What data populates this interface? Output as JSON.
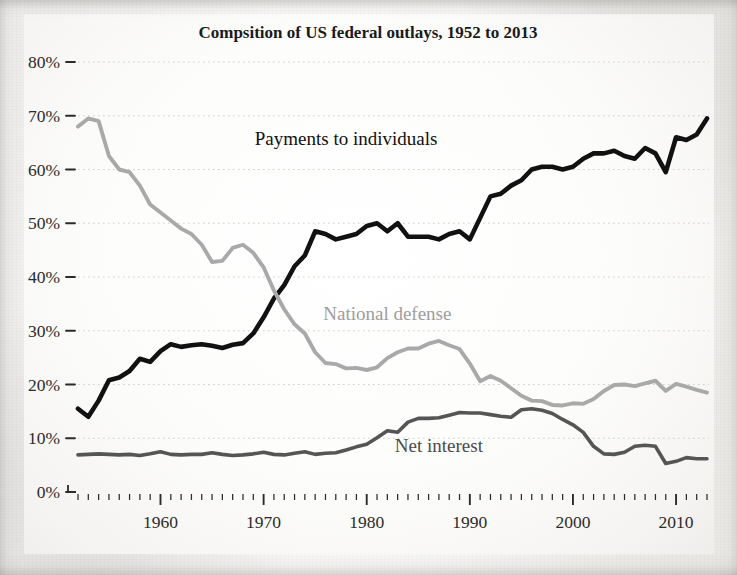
{
  "chart_data": {
    "type": "line",
    "title": "Compsition of US federal outlays, 1952 to 2013",
    "xlabel": "",
    "ylabel": "",
    "xlim": [
      1952,
      2013
    ],
    "ylim": [
      0,
      80
    ],
    "grid": true,
    "grid_axis": "y",
    "legend": "inline-labels",
    "y_tick_labels": [
      "0%",
      "10%",
      "20%",
      "30%",
      "40%",
      "50%",
      "60%",
      "70%",
      "80%"
    ],
    "y_tick_values": [
      0,
      10,
      20,
      30,
      40,
      50,
      60,
      70,
      80
    ],
    "x_tick_labels": [
      "1960",
      "1970",
      "1980",
      "1990",
      "2000",
      "2010"
    ],
    "x_tick_values": [
      1960,
      1970,
      1980,
      1990,
      2000,
      2010
    ],
    "x_minor_tick_step": 1,
    "x": [
      1952,
      1953,
      1954,
      1955,
      1956,
      1957,
      1958,
      1959,
      1960,
      1961,
      1962,
      1963,
      1964,
      1965,
      1966,
      1967,
      1968,
      1969,
      1970,
      1971,
      1972,
      1973,
      1974,
      1975,
      1976,
      1977,
      1978,
      1979,
      1980,
      1981,
      1982,
      1983,
      1984,
      1985,
      1986,
      1987,
      1988,
      1989,
      1990,
      1991,
      1992,
      1993,
      1994,
      1995,
      1996,
      1997,
      1998,
      1999,
      2000,
      2001,
      2002,
      2003,
      2004,
      2005,
      2006,
      2007,
      2008,
      2009,
      2010,
      2011,
      2012,
      2013
    ],
    "series": [
      {
        "name": "Payments to individuals",
        "color": "#111111",
        "label_x": 1978,
        "label_y": 64.5,
        "values": [
          15.5,
          14.0,
          17.0,
          20.8,
          21.3,
          22.5,
          24.8,
          24.2,
          26.2,
          27.5,
          27.0,
          27.3,
          27.5,
          27.2,
          26.8,
          27.4,
          27.7,
          29.5,
          32.5,
          36.0,
          38.5,
          42.0,
          44.0,
          48.5,
          48.0,
          47.0,
          47.5,
          48.0,
          49.5,
          50.0,
          48.5,
          50.0,
          47.5,
          47.5,
          47.5,
          47.0,
          48.0,
          48.5,
          47.0,
          51.0,
          55.0,
          55.5,
          57.0,
          58.0,
          60.0,
          60.5,
          60.5,
          60.0,
          60.5,
          62.0,
          63.0,
          63.0,
          63.5,
          62.5,
          62.0,
          64.0,
          63.0,
          59.5,
          66.0,
          65.5,
          66.5,
          69.5
        ]
      },
      {
        "name": "National defense",
        "color": "#a9a9a9",
        "label_x": 1982,
        "label_y": 32.0,
        "values": [
          68.0,
          69.5,
          69.0,
          62.5,
          60.0,
          59.5,
          57.0,
          53.5,
          52.0,
          50.5,
          49.0,
          48.0,
          46.0,
          42.8,
          43.0,
          45.4,
          46.0,
          44.5,
          41.8,
          37.5,
          34.0,
          31.2,
          29.5,
          26.0,
          24.0,
          23.8,
          23.0,
          23.1,
          22.7,
          23.2,
          24.9,
          26.0,
          26.7,
          26.7,
          27.6,
          28.1,
          27.3,
          26.6,
          23.9,
          20.6,
          21.6,
          20.7,
          19.3,
          17.9,
          17.0,
          16.9,
          16.2,
          16.1,
          16.5,
          16.4,
          17.3,
          18.8,
          19.9,
          20.0,
          19.7,
          20.2,
          20.7,
          18.8,
          20.1,
          19.6,
          19.0,
          18.5
        ]
      },
      {
        "name": "Net interest",
        "color": "#555555",
        "label_x": 1987,
        "label_y": 7.5,
        "values": [
          6.9,
          7.0,
          7.1,
          7.0,
          6.9,
          7.0,
          6.8,
          7.1,
          7.5,
          7.0,
          6.9,
          7.0,
          7.0,
          7.3,
          7.0,
          6.8,
          6.9,
          7.1,
          7.4,
          7.0,
          6.9,
          7.2,
          7.5,
          7.0,
          7.2,
          7.3,
          7.8,
          8.4,
          8.9,
          10.1,
          11.4,
          11.1,
          13.0,
          13.7,
          13.7,
          13.8,
          14.3,
          14.8,
          14.7,
          14.7,
          14.4,
          14.1,
          13.9,
          15.3,
          15.5,
          15.2,
          14.6,
          13.5,
          12.5,
          11.1,
          8.5,
          7.1,
          7.0,
          7.4,
          8.5,
          8.7,
          8.5,
          5.3,
          5.7,
          6.4,
          6.2,
          6.2
        ]
      }
    ]
  }
}
